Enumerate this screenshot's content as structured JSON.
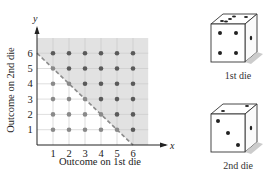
{
  "chart_data": {
    "type": "scatter",
    "title": "",
    "xlabel": "Outcome on 1st die",
    "ylabel": "Outcome on 2nd die",
    "x_axis_letter": "x",
    "y_axis_letter": "y",
    "x_ticks": [
      "1",
      "2",
      "3",
      "4",
      "5",
      "6"
    ],
    "y_ticks": [
      "1",
      "2",
      "3",
      "4",
      "5",
      "6"
    ],
    "xlim": [
      0,
      7
    ],
    "ylim": [
      0,
      7
    ],
    "grid": true,
    "shaded_region": "x + y >= 7 (above dashed line x + y = 6)",
    "dashed_line": {
      "from": [
        0,
        6
      ],
      "to": [
        6,
        0
      ]
    },
    "series": [
      {
        "name": "sum >= 7 (shaded region, darker)",
        "points": [
          [
            1,
            6
          ],
          [
            2,
            6
          ],
          [
            3,
            6
          ],
          [
            4,
            6
          ],
          [
            5,
            6
          ],
          [
            6,
            6
          ],
          [
            2,
            5
          ],
          [
            3,
            5
          ],
          [
            4,
            5
          ],
          [
            5,
            5
          ],
          [
            6,
            5
          ],
          [
            3,
            4
          ],
          [
            4,
            4
          ],
          [
            5,
            4
          ],
          [
            6,
            4
          ],
          [
            4,
            3
          ],
          [
            5,
            3
          ],
          [
            6,
            3
          ],
          [
            5,
            2
          ],
          [
            6,
            2
          ],
          [
            6,
            1
          ]
        ]
      },
      {
        "name": "sum <= 6",
        "points": [
          [
            1,
            5
          ],
          [
            1,
            4
          ],
          [
            2,
            4
          ],
          [
            1,
            3
          ],
          [
            2,
            3
          ],
          [
            3,
            3
          ],
          [
            1,
            2
          ],
          [
            2,
            2
          ],
          [
            3,
            2
          ],
          [
            4,
            2
          ],
          [
            1,
            1
          ],
          [
            2,
            1
          ],
          [
            3,
            1
          ],
          [
            4,
            1
          ],
          [
            5,
            1
          ]
        ]
      }
    ]
  },
  "dice": [
    {
      "label": "1st die",
      "top_face": 5,
      "front_face": 4,
      "side_face": 1
    },
    {
      "label": "2nd die",
      "top_face": 2,
      "front_face": 3,
      "side_face": 1
    }
  ],
  "colors": {
    "shade": "#e2e2e2",
    "grid": "#c8c8c8",
    "point_dark": "#5a5a5a",
    "point_light": "#8a8a8a",
    "dashed": "#8c8c8c",
    "axis": "#222222"
  }
}
